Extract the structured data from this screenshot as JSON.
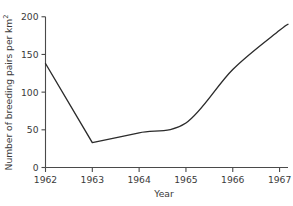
{
  "chart_data": {
    "type": "line",
    "title": "",
    "xlabel": "Year",
    "ylabel": "Number of breeding pairs per km²",
    "ylabel_main": "Number of breeding pairs per km",
    "ylabel_superscript": "2",
    "x": [
      1962,
      1963,
      1964,
      1965,
      1966,
      1967
    ],
    "values": [
      138,
      33,
      46,
      59,
      130,
      190
    ],
    "series": [
      {
        "name": "Breeding pairs",
        "x": [
          1962,
          1963,
          1964,
          1965,
          1966,
          1967,
          1967.18
        ],
        "values": [
          138,
          33,
          46,
          59,
          130,
          182,
          190
        ]
      }
    ],
    "xlim": [
      1962,
      1967.18
    ],
    "ylim": [
      0,
      205
    ],
    "xticks": [
      1962,
      1963,
      1964,
      1965,
      1966,
      1967
    ],
    "xtick_labels": [
      "1962",
      "1963",
      "1964",
      "1965",
      "1966",
      "1967"
    ],
    "yticks": [
      0,
      50,
      100,
      150,
      200
    ],
    "ytick_labels": [
      "0",
      "50",
      "100",
      "150",
      "200"
    ],
    "grid": false,
    "legend": false,
    "line_color": "#2b2b2b",
    "axis_color": "#4a4a4a",
    "background": "#ffffff"
  },
  "figure": {
    "top_clipped_text": ""
  }
}
